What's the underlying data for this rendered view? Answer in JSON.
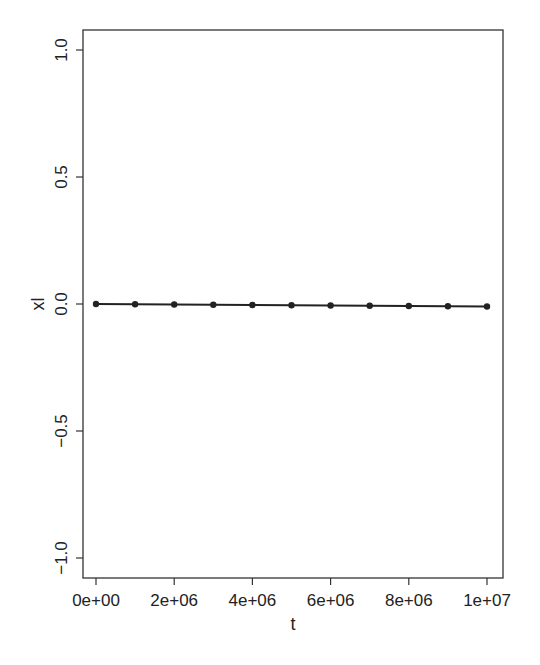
{
  "chart_data": {
    "type": "line",
    "title": "",
    "xlabel": "t",
    "ylabel": "xl",
    "x": [
      0,
      1000000,
      2000000,
      3000000,
      4000000,
      5000000,
      6000000,
      7000000,
      8000000,
      9000000,
      10000000
    ],
    "series": [
      {
        "name": "xl",
        "values": [
          0.0,
          -0.001,
          -0.002,
          -0.003,
          -0.004,
          -0.005,
          -0.006,
          -0.007,
          -0.008,
          -0.009,
          -0.01
        ],
        "color": "#222222",
        "markers": true
      }
    ],
    "xlim": [
      -400000,
      10400000
    ],
    "ylim": [
      -1.08,
      1.08
    ],
    "xticks": [
      0,
      2000000,
      4000000,
      6000000,
      8000000,
      10000000
    ],
    "xtick_labels": [
      "0e+00",
      "2e+06",
      "4e+06",
      "6e+06",
      "8e+06",
      "1e+07"
    ],
    "yticks": [
      1.0,
      0.5,
      0.0,
      -0.5,
      -1.0
    ],
    "ytick_labels": [
      "1.0",
      "0.5",
      "0.0",
      "−0.5",
      "−1.0"
    ],
    "grid": false,
    "legend": null
  }
}
